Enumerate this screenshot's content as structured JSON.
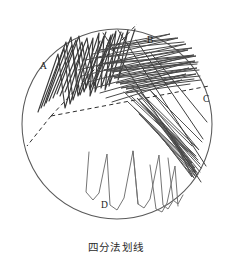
{
  "figure": {
    "caption": "四分法划线",
    "background_color": "#ffffff",
    "width": 232,
    "height": 265
  },
  "dish": {
    "name": "petri-dish",
    "center_x": 117,
    "center_y": 124,
    "radius": 95,
    "stroke_color": "#5a5a5a"
  },
  "dividers": {
    "vertex_x": 51,
    "vertex_y": 116,
    "stroke_color": "#2e2e2e",
    "lines": [
      {
        "name": "divider-a-b",
        "x1": 51,
        "y1": 116,
        "x2": 137,
        "y2": 24
      },
      {
        "name": "divider-b-c",
        "x1": 51,
        "y1": 116,
        "x2": 209,
        "y2": 86
      },
      {
        "name": "divider-a-d",
        "x1": 51,
        "y1": 116,
        "x2": 27,
        "y2": 146
      }
    ]
  },
  "quadrants": [
    {
      "id": "A",
      "label": "A",
      "label_x": 40,
      "label_y": 62,
      "description": "primary-streak-dense",
      "stroke_color": "#3a3a3a"
    },
    {
      "id": "B",
      "label": "B",
      "label_x": 147,
      "label_y": 36,
      "description": "secondary-streak-horizontal",
      "stroke_color": "#4a4a4a"
    },
    {
      "id": "C",
      "label": "C",
      "label_x": 203,
      "label_y": 95,
      "description": "tertiary-streak-diagonal",
      "stroke_color": "#525252"
    },
    {
      "id": "D",
      "label": "D",
      "label_x": 101,
      "label_y": 201,
      "description": "quaternary-streak-sparse-zigzag",
      "stroke_color": "#6e6e6e"
    }
  ]
}
